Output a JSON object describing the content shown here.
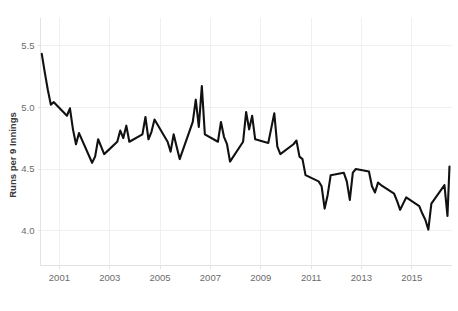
{
  "chart_data": {
    "type": "line",
    "title": "",
    "xlabel": "",
    "ylabel": "Runs per 9 Innings",
    "xlim": [
      2000.25,
      2016.6
    ],
    "ylim": [
      3.72,
      5.72
    ],
    "grid": true,
    "legend": false,
    "legend_position": "none",
    "x_tick_labels": [
      "2001",
      "2003",
      "2005",
      "2007",
      "2009",
      "2011",
      "2013",
      "2015"
    ],
    "x_tick_values": [
      2001,
      2003,
      2005,
      2007,
      2009,
      2011,
      2013,
      2015
    ],
    "y_tick_labels": [
      "5.5",
      "5.0",
      "4.5",
      "4.0"
    ],
    "y_tick_values": [
      5.5,
      5.0,
      4.5,
      4.0
    ],
    "series": [
      {
        "name": "Runs per 9 Innings",
        "color": "#111111",
        "x": [
          2000.3,
          2000.42,
          2000.54,
          2000.66,
          2000.78,
          2001.3,
          2001.42,
          2001.54,
          2001.66,
          2001.78,
          2002.3,
          2002.42,
          2002.54,
          2002.66,
          2002.78,
          2003.3,
          2003.42,
          2003.54,
          2003.66,
          2003.78,
          2004.3,
          2004.42,
          2004.54,
          2004.66,
          2004.78,
          2005.3,
          2005.42,
          2005.54,
          2005.66,
          2005.78,
          2006.3,
          2006.42,
          2006.54,
          2006.66,
          2006.78,
          2007.3,
          2007.42,
          2007.54,
          2007.66,
          2007.78,
          2008.3,
          2008.42,
          2008.54,
          2008.66,
          2008.78,
          2009.3,
          2009.42,
          2009.54,
          2009.66,
          2009.78,
          2010.3,
          2010.42,
          2010.54,
          2010.66,
          2010.78,
          2011.3,
          2011.42,
          2011.54,
          2011.66,
          2011.78,
          2012.3,
          2012.42,
          2012.54,
          2012.66,
          2012.78,
          2013.3,
          2013.42,
          2013.54,
          2013.66,
          2013.78,
          2014.3,
          2014.42,
          2014.54,
          2014.66,
          2014.78,
          2015.3,
          2015.42,
          2015.54,
          2015.66,
          2015.78,
          2016.3,
          2016.42,
          2016.5
        ],
        "values": [
          5.43,
          5.28,
          5.14,
          5.02,
          5.04,
          4.93,
          4.99,
          4.82,
          4.7,
          4.79,
          4.55,
          4.6,
          4.74,
          4.68,
          4.62,
          4.72,
          4.81,
          4.75,
          4.85,
          4.72,
          4.78,
          4.92,
          4.74,
          4.8,
          4.9,
          4.72,
          4.64,
          4.78,
          4.68,
          4.58,
          4.88,
          5.06,
          4.84,
          5.17,
          4.78,
          4.72,
          4.88,
          4.76,
          4.7,
          4.56,
          4.72,
          4.96,
          4.82,
          4.93,
          4.74,
          4.71,
          4.83,
          4.95,
          4.68,
          4.62,
          4.7,
          4.73,
          4.6,
          4.58,
          4.45,
          4.4,
          4.36,
          4.18,
          4.29,
          4.45,
          4.47,
          4.4,
          4.25,
          4.47,
          4.5,
          4.48,
          4.36,
          4.31,
          4.39,
          4.37,
          4.3,
          4.24,
          4.17,
          4.22,
          4.27,
          4.2,
          4.14,
          4.09,
          4.01,
          4.22,
          4.37,
          4.12,
          4.52
        ]
      }
    ]
  }
}
